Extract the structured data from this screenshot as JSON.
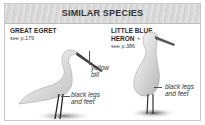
{
  "panel": {
    "title": "SIMILAR SPECIES",
    "species": [
      {
        "name": "GREAT EGRET",
        "see": "see p.179",
        "annotations": [
          "yellow bill",
          "black legs and feet"
        ],
        "annotation_lines": {
          "bill_1": "yellow",
          "bill_2": "bill",
          "legs_1": "black legs",
          "legs_2": "and feet"
        }
      },
      {
        "name_line1": "LITTLE BLUE",
        "name_line2": "HERON",
        "status_icon": "partial-circle-icon",
        "status_glyph": "◔",
        "see": "see p.386",
        "annotation_lines": {
          "legs_1": "black legs",
          "legs_2": "and feet"
        }
      }
    ]
  }
}
